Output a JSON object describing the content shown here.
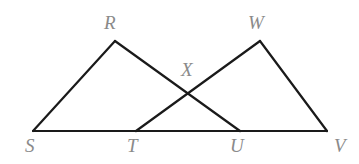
{
  "figure": {
    "type": "geometry-diagram",
    "background_color": "#ffffff",
    "stroke_color": "#1a1a1a",
    "label_color": "#8a8a8a",
    "stroke_width": 2.2,
    "points": {
      "S": {
        "label": "S",
        "x": 33,
        "y": 131,
        "label_x": 25,
        "label_y": 136
      },
      "R": {
        "label": "R",
        "x": 115,
        "y": 41,
        "label_x": 104,
        "label_y": 13
      },
      "T": {
        "label": "T",
        "x": 136,
        "y": 131,
        "label_x": 127,
        "label_y": 136
      },
      "X": {
        "label": "X",
        "x": 188,
        "y": 90,
        "label_x": 181,
        "label_y": 60
      },
      "W": {
        "label": "W",
        "x": 260,
        "y": 41,
        "label_x": 248,
        "label_y": 13
      },
      "U": {
        "label": "U",
        "x": 240,
        "y": 131,
        "label_x": 230,
        "label_y": 136
      },
      "V": {
        "label": "V",
        "x": 327,
        "y": 131,
        "label_x": 334,
        "label_y": 136
      }
    },
    "segments": [
      {
        "name": "baseline-SV",
        "from": "S",
        "to": "V"
      },
      {
        "name": "segment-SR",
        "from": "S",
        "to": "R"
      },
      {
        "name": "segment-RU",
        "from": "R",
        "to": "U"
      },
      {
        "name": "segment-TW",
        "from": "T",
        "to": "W"
      },
      {
        "name": "segment-WV",
        "from": "W",
        "to": "V"
      }
    ]
  }
}
